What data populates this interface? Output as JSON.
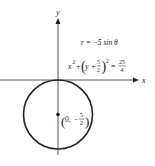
{
  "figure": {
    "type": "polar-graph",
    "axes": {
      "x_label": "x",
      "y_label": "y"
    },
    "equations": {
      "polar": "r = −5 sin θ",
      "cartesian_lhs_x": "x",
      "cartesian_exp": "2",
      "cartesian_plus": "+",
      "cartesian_y": "y +",
      "cartesian_num": "5",
      "cartesian_den": "2",
      "cartesian_eq": "=",
      "cartesian_rhs_num": "25",
      "cartesian_rhs_den": "4"
    },
    "center_label": {
      "x": "0,",
      "minus": "−",
      "num": "5",
      "den": "2"
    },
    "circle": {
      "center": [
        0,
        -2.5
      ],
      "radius": 2.5
    },
    "colors": {
      "stroke": "#222222",
      "axis": "#444444"
    }
  }
}
